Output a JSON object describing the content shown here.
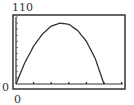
{
  "chart_data": {
    "type": "line",
    "title": "",
    "xlabel": "",
    "ylabel": "",
    "window": {
      "xmin": 0,
      "ymin": 0,
      "ymax": 110
    },
    "tick_labels": {
      "y_top": "110",
      "y_bottom": "0",
      "x_left": "0"
    },
    "x_tick_count": 6,
    "y_tick_count": 11,
    "grid": false,
    "series": [
      {
        "name": "parabola",
        "shape": "downward-opening parabola",
        "x": [
          0,
          0.5,
          1,
          1.5,
          2,
          2.5,
          3,
          3.5,
          4,
          4.5,
          5
        ],
        "y": [
          0,
          35,
          62,
          82,
          95,
          100,
          98,
          88,
          70,
          42,
          0
        ]
      }
    ],
    "line_color": "#333333"
  }
}
